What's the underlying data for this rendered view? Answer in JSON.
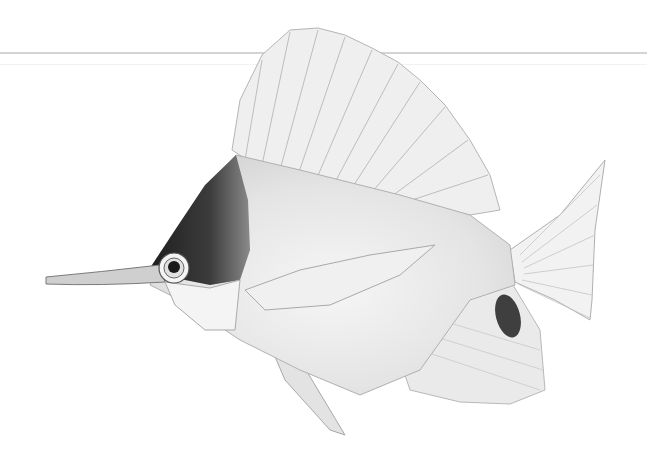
{
  "image": {
    "subject": "butterflyfish illustration (long-nosed)",
    "style": "grayscale pencil/engraving illustration",
    "background": "#ffffff",
    "width": 647,
    "height": 467
  },
  "colors": {
    "line": "#d4d4d4",
    "body": "#e6e6e6",
    "fin": "#ececec",
    "head_dark": "#3a3a3a",
    "spot": "#4a4a4a",
    "outline": "#9a9a9a"
  }
}
